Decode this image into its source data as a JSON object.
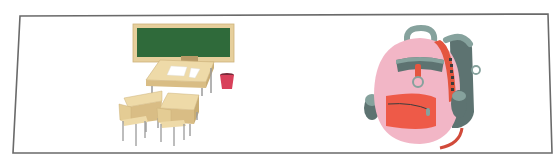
{
  "frame": {
    "stroke": "#6a6a6a",
    "points": "20,16 548,14 552,153 13,153"
  },
  "illustrations": [
    {
      "name": "classroom",
      "description": "Classroom with green chalkboard, teacher desk with papers, red trash bin, two student desks with chairs",
      "colors": {
        "chalkboard": "#2f6a3a",
        "board_frame": "#e6cf9c",
        "wood": "#e9d29e",
        "wood_dark": "#c9ad74",
        "legs": "#9a9a9a",
        "bin": "#d8405a"
      }
    },
    {
      "name": "backpack",
      "description": "Pink backpack with grey-green straps and handle, red-orange front pocket and side strap",
      "colors": {
        "body": "#f2b6c6",
        "pocket": "#ee5a48",
        "strap": "#e4553f",
        "grey": "#5d7371",
        "grey_light": "#86a29d"
      }
    }
  ]
}
